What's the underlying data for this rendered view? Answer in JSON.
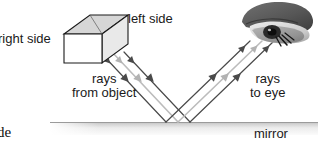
{
  "figure": {
    "background_color": "#ffffff"
  },
  "labels": {
    "right_side": "right side",
    "left_side": "left side",
    "rays_from_object_line1": "rays",
    "rays_from_object_line2": "from object",
    "rays_to_eye_line1": "rays",
    "rays_to_eye_line2": "to eye",
    "mirror": "mirror",
    "cropped_text": "de"
  },
  "colors": {
    "ray_dark": "#4a4a4a",
    "ray_light": "#b9b9b9",
    "outline": "#1a1a1a",
    "box_front": "#ffffff",
    "box_top": "#d8d8d8",
    "box_side": "#ededed",
    "mirror_band_top": "#a8a8a8",
    "mirror_band_bottom": "#f2f2f2",
    "eye_dark": "#4d4d4d",
    "eye_mid": "#8a8a8a",
    "eye_light": "#c7c7c7",
    "pupil": "#141414",
    "text": "#1a1a1a"
  },
  "diagram": {
    "object": {
      "name": "rectangular-slab",
      "front_face": "right side",
      "angled_face": "left side"
    },
    "mirror": {
      "y": 122,
      "x_start": 50,
      "x_end": 318
    },
    "incident_rays": [
      {
        "shade": "ray_dark",
        "x1": 100,
        "y1": 54,
        "x2": 165,
        "y2": 122
      },
      {
        "shade": "ray_light",
        "x1": 112,
        "y1": 54,
        "x2": 177,
        "y2": 122
      },
      {
        "shade": "ray_dark",
        "x1": 124,
        "y1": 54,
        "x2": 189,
        "y2": 122
      }
    ],
    "reflected_rays": [
      {
        "shade": "ray_dark",
        "x1": 165,
        "y1": 122,
        "x2": 248,
        "y2": 42
      },
      {
        "shade": "ray_light",
        "x1": 177,
        "y1": 122,
        "x2": 260,
        "y2": 42
      },
      {
        "shade": "ray_dark",
        "x1": 189,
        "y1": 122,
        "x2": 272,
        "y2": 42
      }
    ]
  }
}
